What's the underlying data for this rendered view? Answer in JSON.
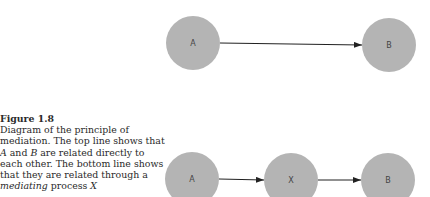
{
  "caption": {
    "title": "Figure 1.8",
    "segments": [
      {
        "text": "Diagram of the principle of mediation. The top line shows that ",
        "italic": false
      },
      {
        "text": "A",
        "italic": true
      },
      {
        "text": " and ",
        "italic": false
      },
      {
        "text": "B",
        "italic": true
      },
      {
        "text": " are related directly to each other. The bottom line shows that they are related through a ",
        "italic": false
      },
      {
        "text": "mediating",
        "italic": true
      },
      {
        "text": " process ",
        "italic": false
      },
      {
        "text": "X",
        "italic": true
      }
    ]
  },
  "diagram": {
    "node_color": "#b4b4b4",
    "edge_color": "#222222",
    "radius": 27,
    "top_row": {
      "nodes": [
        {
          "id": "A",
          "label": "A",
          "cx": 193,
          "cy": 43
        },
        {
          "id": "B",
          "label": "B",
          "cx": 389,
          "cy": 45
        }
      ],
      "edges": [
        {
          "from": "A",
          "to": "B"
        }
      ]
    },
    "bottom_row": {
      "nodes": [
        {
          "id": "A",
          "label": "A",
          "cx": 192,
          "cy": 179
        },
        {
          "id": "X",
          "label": "X",
          "cx": 291,
          "cy": 180
        },
        {
          "id": "B",
          "label": "B",
          "cx": 388,
          "cy": 180
        }
      ],
      "edges": [
        {
          "from": "A",
          "to": "X"
        },
        {
          "from": "X",
          "to": "B"
        }
      ]
    }
  }
}
